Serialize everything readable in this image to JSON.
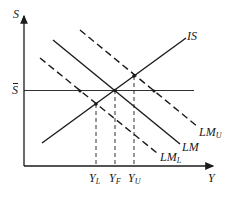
{
  "diagram": {
    "type": "IS-LM diagram",
    "axes": {
      "y_label": "S",
      "x_label": "Y"
    },
    "reference_line": {
      "label": "S",
      "bar": true,
      "description": "S-bar horizontal line"
    },
    "curves": {
      "is": {
        "label": "IS",
        "style": "solid"
      },
      "lm": {
        "label": "LM",
        "style": "solid"
      },
      "lm_u": {
        "label": "LM",
        "sub": "U",
        "style": "dashed"
      },
      "lm_l": {
        "label": "LM",
        "sub": "L",
        "style": "dashed"
      }
    },
    "x_ticks": [
      {
        "label": "Y",
        "sub": "L"
      },
      {
        "label": "Y",
        "sub": "F"
      },
      {
        "label": "Y",
        "sub": "U"
      }
    ],
    "colors": {
      "ink": "#1a1a1a",
      "background": "#ffffff"
    }
  }
}
